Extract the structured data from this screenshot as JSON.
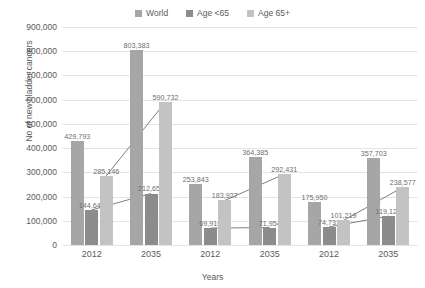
{
  "chart_data": {
    "type": "bar",
    "title": "",
    "xlabel": "Years",
    "ylabel": "No of new bladder cancers",
    "ylim": [
      0,
      900000
    ],
    "ytick_labels": [
      "0",
      "100,000",
      "200,000",
      "300,000",
      "400,000",
      "500,000",
      "600,000",
      "700,000",
      "800,000",
      "900,000"
    ],
    "ytick_values": [
      0,
      100000,
      200000,
      300000,
      400000,
      500000,
      600000,
      700000,
      800000,
      900000
    ],
    "grid": true,
    "legend_position": "top",
    "categories": [
      "2012",
      "2035",
      "2012",
      "2035",
      "2012",
      "2035"
    ],
    "series": [
      {
        "name": "World",
        "color": "#a6a6a6",
        "values": [
          429793,
          803383,
          253843,
          364385,
          175950,
          357703
        ],
        "labels": [
          "429,793",
          "803,383",
          "253,843",
          "364,385",
          "175,950",
          "357,703"
        ]
      },
      {
        "name": "Age <65",
        "color": "#8c8c8c",
        "values": [
          144647,
          212651,
          69916,
          71954,
          74731,
          119126
        ],
        "labels": [
          "144,647",
          "212,651",
          "69,916",
          "71,954",
          "74,731",
          "119,126"
        ]
      },
      {
        "name": "Age 65+",
        "color": "#c3c3c3",
        "values": [
          285146,
          590732,
          183927,
          292431,
          101219,
          238577
        ],
        "labels": [
          "285,146",
          "590,732",
          "183,927",
          "292,431",
          "101,219",
          "238,577"
        ]
      }
    ],
    "connector_pairs": [
      [
        0,
        1
      ],
      [
        2,
        3
      ],
      [
        4,
        5
      ]
    ],
    "connector_series": [
      "Age <65",
      "Age 65+"
    ],
    "connector_color": "#808080",
    "background": "#ffffff",
    "gridline_color": "#e4e4e4"
  },
  "legend": {
    "items": [
      {
        "label": "World",
        "color": "#a6a6a6"
      },
      {
        "label": "Age <65",
        "color": "#8c8c8c"
      },
      {
        "label": "Age 65+",
        "color": "#c3c3c3"
      }
    ]
  },
  "axes": {
    "y_title": "No of new bladder cancers",
    "x_title": "Years"
  }
}
